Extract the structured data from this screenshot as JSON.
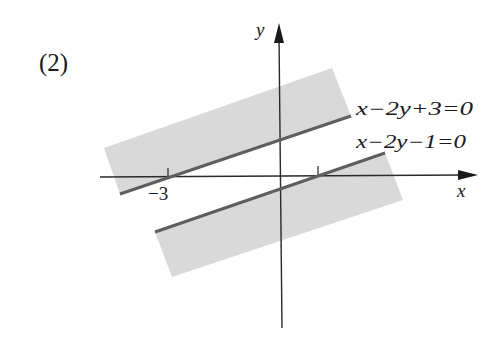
{
  "figure": {
    "label": "(2)",
    "axes": {
      "x_label": "x",
      "y_label": "y",
      "ticks": [
        {
          "value": -3,
          "label": "−3"
        },
        {
          "value": 1,
          "label": ""
        }
      ]
    },
    "lines": [
      {
        "equation": "x−2y+3=0",
        "points": "120,194 351,116"
      },
      {
        "equation": "x−2y−1=0",
        "points": "155,232 385,153"
      }
    ],
    "shaded_regions": [
      {
        "description": "region bounded below by x−2y+3=0",
        "points": "104,148 332,68 351,116 120,194"
      },
      {
        "description": "region bounded above by x−2y−1=0",
        "points": "155,232 385,153 403,200 172,277"
      }
    ],
    "colors": {
      "region_fill": "#d9d9d9",
      "boundary_line": "#5e5e5e",
      "axis": "#2a2a2a"
    }
  }
}
